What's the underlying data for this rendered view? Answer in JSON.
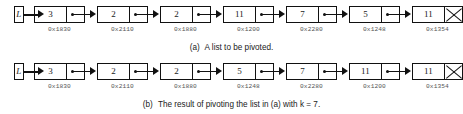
{
  "figure": {
    "panels": [
      {
        "id": "panel-a",
        "head_label": "L",
        "caption_label": "(a)",
        "caption_text": "A list to be pivoted.",
        "nodes": [
          {
            "value": "3",
            "address": "0x1830",
            "next": "pointer"
          },
          {
            "value": "2",
            "address": "0x2110",
            "next": "pointer"
          },
          {
            "value": "2",
            "address": "0x1880",
            "next": "pointer"
          },
          {
            "value": "11",
            "address": "0x1200",
            "next": "pointer"
          },
          {
            "value": "7",
            "address": "0x2280",
            "next": "pointer"
          },
          {
            "value": "5",
            "address": "0x1248",
            "next": "pointer"
          },
          {
            "value": "11",
            "address": "0x1354",
            "next": "null"
          }
        ]
      },
      {
        "id": "panel-b",
        "head_label": "L",
        "caption_label": "(b)",
        "caption_text": "The result of pivoting the list in (a) with k = 7.",
        "nodes": [
          {
            "value": "3",
            "address": "0x1830",
            "next": "pointer"
          },
          {
            "value": "2",
            "address": "0x2110",
            "next": "pointer"
          },
          {
            "value": "2",
            "address": "0x1880",
            "next": "pointer"
          },
          {
            "value": "5",
            "address": "0x1248",
            "next": "pointer"
          },
          {
            "value": "7",
            "address": "0x2280",
            "next": "pointer"
          },
          {
            "value": "11",
            "address": "0x1200",
            "next": "pointer"
          },
          {
            "value": "11",
            "address": "0x1354",
            "next": "null"
          }
        ]
      }
    ]
  }
}
